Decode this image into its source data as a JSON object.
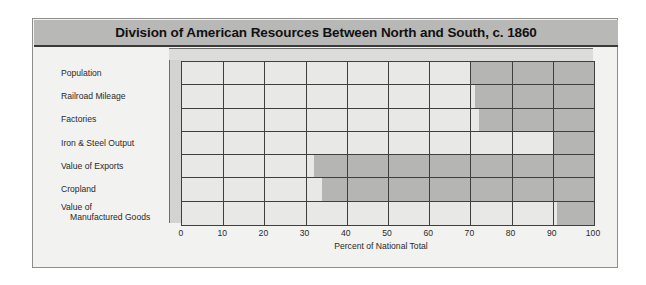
{
  "chart": {
    "title": "Division of American Resources Between North and South, c. 1860",
    "axis_title": "Percent of National Total"
  },
  "colors": {
    "background": "#f2f2f0",
    "title_band": "#b8b8b6",
    "south_light": "#e8e8e6",
    "north_dark": "#b5b5b3",
    "grid_line": "#3f3f3d"
  },
  "chart_data": {
    "type": "bar",
    "orientation": "horizontal",
    "stacked": true,
    "title": "Division of American Resources Between North and South, c. 1860",
    "xlabel": "Percent of National Total",
    "ylabel": "",
    "xlim": [
      0,
      100
    ],
    "grid": true,
    "legend": null,
    "categories": [
      "Population",
      "Railroad Mileage",
      "Factories",
      "Iron & Steel Output",
      "Value of Exports",
      "Cropland",
      "Value of Manufactured Goods"
    ],
    "tick_labels": [
      "0",
      "10",
      "20",
      "30",
      "40",
      "50",
      "60",
      "70",
      "80",
      "90",
      "100"
    ],
    "tick_values": [
      0,
      10,
      20,
      30,
      40,
      50,
      60,
      70,
      80,
      90,
      100
    ],
    "series": [
      {
        "name": "South",
        "color": "#e8e8e6",
        "values": [
          70,
          71,
          72,
          90,
          32,
          34,
          91
        ]
      },
      {
        "name": "North",
        "color": "#b5b5b3",
        "values": [
          30,
          29,
          28,
          10,
          68,
          66,
          9
        ]
      }
    ],
    "rows": [
      {
        "label": "Population",
        "label_line1": "Population",
        "label_line2": "",
        "south": 70,
        "north": 30
      },
      {
        "label": "Railroad Mileage",
        "label_line1": "Railroad Mileage",
        "label_line2": "",
        "south": 71,
        "north": 29
      },
      {
        "label": "Factories",
        "label_line1": "Factories",
        "label_line2": "",
        "south": 72,
        "north": 28
      },
      {
        "label": "Iron & Steel Output",
        "label_line1": "Iron & Steel Output",
        "label_line2": "",
        "south": 90,
        "north": 10
      },
      {
        "label": "Value of Exports",
        "label_line1": "Value of Exports",
        "label_line2": "",
        "south": 32,
        "north": 68
      },
      {
        "label": "Cropland",
        "label_line1": "Cropland",
        "label_line2": "",
        "south": 34,
        "north": 66
      },
      {
        "label": "Value of Manufactured Goods",
        "label_line1": "Value of",
        "label_line2": "Manufactured Goods",
        "south": 91,
        "north": 9
      }
    ]
  }
}
